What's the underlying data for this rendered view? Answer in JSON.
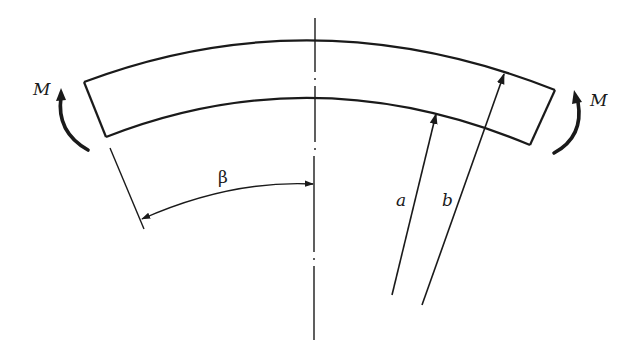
{
  "figure": {
    "labels": {
      "moment_left": "M",
      "moment_right": "M",
      "angle": "β",
      "inner_radius": "a",
      "outer_radius": "b"
    },
    "colors": {
      "stroke": "#1a1a1a",
      "background": "#ffffff"
    }
  }
}
